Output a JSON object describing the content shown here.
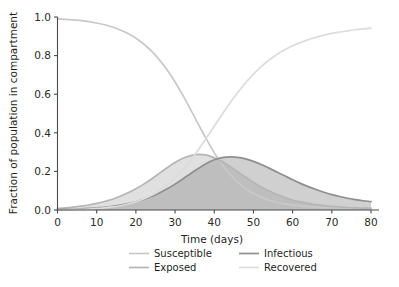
{
  "chart_data": {
    "type": "line",
    "title": "",
    "xlabel": "Time (days)",
    "ylabel": "Fraction of population in compartment",
    "xlim": [
      0,
      80
    ],
    "ylim": [
      0.0,
      1.0
    ],
    "grid": false,
    "legend_position": "below-center",
    "xticks": [
      0,
      10,
      20,
      30,
      40,
      50,
      60,
      70,
      80
    ],
    "xtick_labels": [
      "0",
      "10",
      "20",
      "30",
      "40",
      "50",
      "60",
      "70",
      "80"
    ],
    "yticks": [
      0.0,
      0.2,
      0.4,
      0.6,
      0.8,
      1.0
    ],
    "ytick_labels": [
      "0.0",
      "0.2",
      "0.4",
      "0.6",
      "0.8",
      "1.0"
    ],
    "x": [
      0,
      2,
      4,
      6,
      8,
      10,
      12,
      14,
      16,
      18,
      20,
      22,
      24,
      26,
      28,
      30,
      32,
      34,
      36,
      38,
      40,
      42,
      44,
      46,
      48,
      50,
      52,
      54,
      56,
      58,
      60,
      62,
      64,
      66,
      68,
      70,
      72,
      74,
      76,
      78,
      80
    ],
    "series": [
      {
        "name": "Susceptible",
        "color": "#c9c9c9",
        "fill": false,
        "values": [
          0.99,
          0.988,
          0.985,
          0.981,
          0.976,
          0.969,
          0.96,
          0.948,
          0.933,
          0.914,
          0.89,
          0.86,
          0.823,
          0.778,
          0.725,
          0.663,
          0.594,
          0.519,
          0.442,
          0.367,
          0.297,
          0.236,
          0.185,
          0.143,
          0.11,
          0.085,
          0.066,
          0.051,
          0.04,
          0.032,
          0.026,
          0.021,
          0.018,
          0.015,
          0.013,
          0.012,
          0.011,
          0.01,
          0.009,
          0.009,
          0.008
        ]
      },
      {
        "name": "Exposed",
        "color": "#b5b5b5",
        "fill": true,
        "values": [
          0.008,
          0.011,
          0.015,
          0.02,
          0.026,
          0.034,
          0.044,
          0.056,
          0.071,
          0.089,
          0.11,
          0.134,
          0.161,
          0.19,
          0.219,
          0.246,
          0.268,
          0.282,
          0.288,
          0.284,
          0.271,
          0.251,
          0.226,
          0.198,
          0.17,
          0.143,
          0.119,
          0.098,
          0.08,
          0.065,
          0.052,
          0.042,
          0.034,
          0.028,
          0.023,
          0.019,
          0.016,
          0.013,
          0.011,
          0.01,
          0.009
        ]
      },
      {
        "name": "Infectious",
        "color": "#8f8f8f",
        "fill": true,
        "values": [
          0.002,
          0.003,
          0.004,
          0.006,
          0.008,
          0.011,
          0.014,
          0.019,
          0.025,
          0.033,
          0.043,
          0.055,
          0.07,
          0.088,
          0.11,
          0.134,
          0.161,
          0.189,
          0.216,
          0.241,
          0.26,
          0.271,
          0.275,
          0.273,
          0.265,
          0.252,
          0.236,
          0.217,
          0.197,
          0.177,
          0.157,
          0.138,
          0.121,
          0.106,
          0.092,
          0.08,
          0.07,
          0.061,
          0.054,
          0.048,
          0.043
        ]
      },
      {
        "name": "Recovered",
        "color": "#dcdcdc",
        "fill": false,
        "values": [
          0.0,
          0.001,
          0.002,
          0.003,
          0.005,
          0.008,
          0.011,
          0.016,
          0.022,
          0.031,
          0.042,
          0.057,
          0.076,
          0.1,
          0.13,
          0.166,
          0.209,
          0.259,
          0.314,
          0.373,
          0.434,
          0.495,
          0.554,
          0.609,
          0.659,
          0.704,
          0.743,
          0.777,
          0.806,
          0.83,
          0.851,
          0.868,
          0.883,
          0.895,
          0.906,
          0.915,
          0.922,
          0.928,
          0.934,
          0.938,
          0.942
        ]
      }
    ]
  },
  "legend": {
    "entries": [
      {
        "label": "Susceptible",
        "color": "#c9c9c9"
      },
      {
        "label": "Infectious",
        "color": "#8f8f8f"
      },
      {
        "label": "Exposed",
        "color": "#b5b5b5"
      },
      {
        "label": "Recovered",
        "color": "#dcdcdc"
      }
    ]
  },
  "axes": {
    "x_title": "Time (days)",
    "y_title": "Fraction of population in compartment"
  }
}
